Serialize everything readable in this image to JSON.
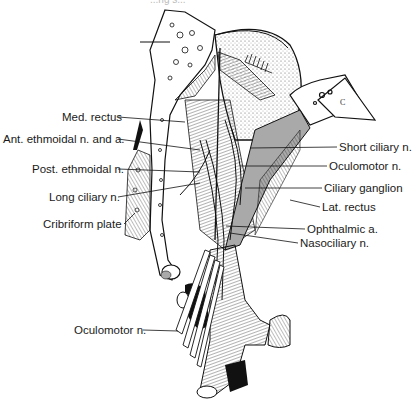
{
  "figure": {
    "title_fragment": "...ng s... "
  },
  "labels_left": [
    {
      "id": "med-rectus",
      "text": "Med. rectus",
      "x": 62,
      "y": 111,
      "line_to": [
        185,
        122
      ]
    },
    {
      "id": "ant-ethmoidal",
      "text": "Ant. ethmoidal n. and a.",
      "x": 3,
      "y": 133,
      "line_to": [
        200,
        150
      ]
    },
    {
      "id": "post-ethmoidal",
      "text": "Post. ethmoidal n.",
      "x": 32,
      "y": 163,
      "line_to": [
        200,
        172
      ]
    },
    {
      "id": "long-ciliary",
      "text": "Long ciliary n.",
      "x": 49,
      "y": 191,
      "line_to": [
        200,
        183
      ]
    },
    {
      "id": "cribriform-plate",
      "text": "Cribriform plate",
      "x": 43,
      "y": 218,
      "line_to": [
        135,
        213
      ]
    }
  ],
  "labels_right": [
    {
      "id": "short-ciliary",
      "text": "Short ciliary n.",
      "x": 339,
      "y": 141,
      "line_to": [
        250,
        148
      ]
    },
    {
      "id": "oculomotor-upper",
      "text": "Oculomotor n.",
      "x": 329,
      "y": 160,
      "line_to": [
        240,
        166
      ]
    },
    {
      "id": "ciliary-ganglion",
      "text": "Ciliary ganglion",
      "x": 324,
      "y": 182,
      "line_to": [
        245,
        188
      ]
    },
    {
      "id": "lat-rectus",
      "text": "Lat. rectus",
      "x": 322,
      "y": 201,
      "line_to": [
        290,
        200
      ]
    },
    {
      "id": "ophthalmic-a",
      "text": "Ophthalmic a.",
      "x": 307,
      "y": 223,
      "line_to": [
        226,
        226
      ]
    },
    {
      "id": "nasociliary",
      "text": "Nasociliary n.",
      "x": 300,
      "y": 237,
      "line_to": [
        230,
        233
      ]
    }
  ],
  "labels_bottom": [
    {
      "id": "oculomotor-lower",
      "text": "Oculomotor n.",
      "x": 74,
      "y": 324,
      "line_to": [
        178,
        331
      ]
    }
  ]
}
